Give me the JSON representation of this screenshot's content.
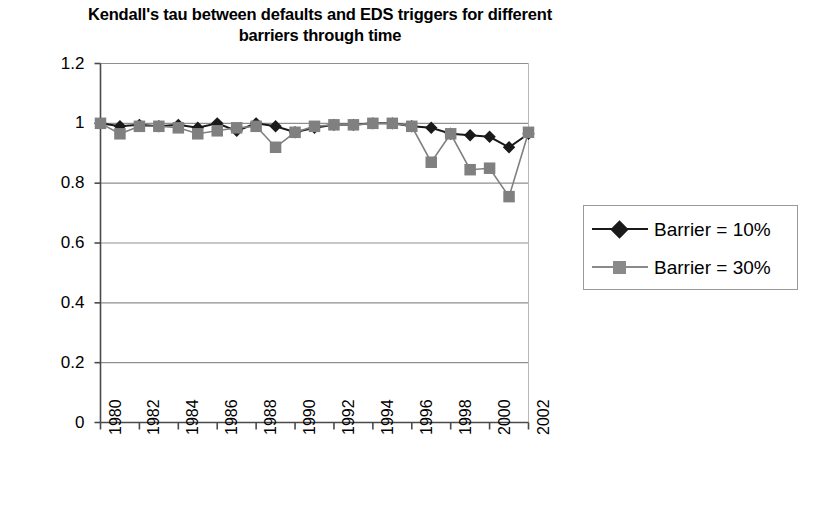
{
  "chart_data": {
    "type": "line",
    "title": "Kendall's tau between defaults and EDS triggers for different barriers through time",
    "title_line1": "Kendall's tau between defaults and EDS triggers for different",
    "title_line2": "barriers through time",
    "xlabel": "",
    "ylabel": "",
    "x": [
      1980,
      1981,
      1982,
      1983,
      1984,
      1985,
      1986,
      1987,
      1988,
      1989,
      1990,
      1991,
      1992,
      1993,
      1994,
      1995,
      1996,
      1997,
      1998,
      1999,
      2000,
      2001,
      2002
    ],
    "xlim": [
      1980,
      2002
    ],
    "ylim": [
      0,
      1.2
    ],
    "yticks": [
      0,
      0.2,
      0.4,
      0.6,
      0.8,
      1,
      1.2
    ],
    "ytick_labels": [
      "0",
      "0.2",
      "0.4",
      "0.6",
      "0.8",
      "1",
      "1.2"
    ],
    "xticks": [
      1980,
      1982,
      1984,
      1986,
      1988,
      1990,
      1992,
      1994,
      1996,
      1998,
      2000,
      2002
    ],
    "xtick_labels": [
      "1980",
      "1982",
      "1984",
      "1986",
      "1988",
      "1990",
      "1992",
      "1994",
      "1996",
      "1998",
      "2000",
      "2002"
    ],
    "grid": "horizontal",
    "legend_position": "right",
    "series": [
      {
        "name": "Barrier = 10%",
        "color": "#1a1a1a",
        "marker": "diamond",
        "values": [
          1.0,
          0.99,
          0.995,
          0.99,
          0.995,
          0.985,
          1.0,
          0.975,
          1.0,
          0.99,
          0.97,
          0.985,
          0.995,
          0.995,
          1.0,
          1.0,
          0.99,
          0.985,
          0.965,
          0.96,
          0.955,
          0.92,
          0.965
        ]
      },
      {
        "name": "Barrier = 30%",
        "color": "#808080",
        "marker": "square",
        "values": [
          1.0,
          0.965,
          0.99,
          0.99,
          0.985,
          0.965,
          0.975,
          0.985,
          0.99,
          0.92,
          0.97,
          0.99,
          0.995,
          0.995,
          1.0,
          1.0,
          0.99,
          0.87,
          0.965,
          0.845,
          0.85,
          0.755,
          0.97
        ]
      }
    ]
  },
  "legend": {
    "items": [
      {
        "label": "Barrier = 10%"
      },
      {
        "label": "Barrier = 30%"
      }
    ]
  }
}
